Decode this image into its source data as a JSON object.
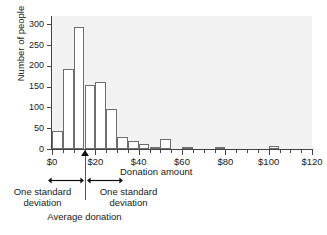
{
  "chart_data": {
    "type": "bar",
    "title": "",
    "xlabel": "Donation amount",
    "ylabel": "Number of people",
    "xlim": [
      0,
      120
    ],
    "ylim": [
      0,
      320
    ],
    "bin_width": 5,
    "grid": false,
    "legend": null,
    "x_tick_labels": [
      "$0",
      "$20",
      "$40",
      "$60",
      "$80",
      "$100",
      "$120"
    ],
    "x_tick_values": [
      0,
      20,
      40,
      60,
      80,
      100,
      120
    ],
    "y_tick_labels": [
      "0",
      "50",
      "100",
      "150",
      "200",
      "250",
      "300"
    ],
    "y_tick_values": [
      0,
      50,
      100,
      150,
      200,
      250,
      300
    ],
    "bin_starts": [
      0,
      5,
      10,
      15,
      20,
      25,
      30,
      35,
      40,
      45,
      50,
      60,
      75,
      100
    ],
    "categories": [
      "$0-5",
      "$5-10",
      "$10-15",
      "$15-20",
      "$20-25",
      "$25-30",
      "$30-35",
      "$35-40",
      "$40-45",
      "$45-50",
      "$50-55",
      "$60-65",
      "$75-80",
      "$100-105"
    ],
    "values": [
      43,
      192,
      293,
      153,
      162,
      97,
      30,
      19,
      13,
      6,
      25,
      5,
      4,
      7
    ]
  },
  "annotations": {
    "average_donation_value": 15,
    "std_dev_left_label": "One standard\ndeviation",
    "std_dev_right_label": "One standard\ndeviation",
    "std_left_line1": "One standard",
    "std_left_line2": "deviation",
    "std_right_line1": "One standard",
    "std_right_line2": "deviation",
    "average_label": "Average donation",
    "marker_icon": "up-triangle-marker"
  },
  "colors": {
    "plot_background": "#f2f2f2",
    "bar_fill": "#ffffff",
    "bar_edge": "#6e6e6e",
    "axis": "#444444",
    "text": "#1a1a1a",
    "page_background": "#ffffff"
  }
}
